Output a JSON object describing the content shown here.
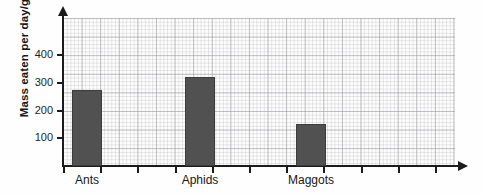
{
  "chart_data": {
    "type": "bar",
    "title": "",
    "xlabel": "",
    "ylabel": "Mass eaten per day/g",
    "categories": [
      "Ants",
      "Aphids",
      "Maggots"
    ],
    "values": [
      275,
      320,
      150
    ],
    "ylim": [
      0,
      500
    ],
    "ytick_labels": [
      "100",
      "200",
      "300",
      "400"
    ],
    "ytick_values": [
      100,
      200,
      300,
      400
    ],
    "grid": true,
    "grid_style": "graph-paper",
    "legend": "none",
    "bar_color": "#515151",
    "axis_color": "#1b1b1b"
  },
  "axes": {
    "y_title": "Mass eaten per day/g",
    "y_ticks": [
      {
        "label": "400",
        "value": 400
      },
      {
        "label": "300",
        "value": 300
      },
      {
        "label": "200",
        "value": 200
      },
      {
        "label": "100",
        "value": 100
      }
    ]
  },
  "bars": [
    {
      "label": "Ants",
      "value": 275
    },
    {
      "label": "Aphids",
      "value": 320
    },
    {
      "label": "Maggots",
      "value": 150
    }
  ],
  "x_tick_count": 11
}
